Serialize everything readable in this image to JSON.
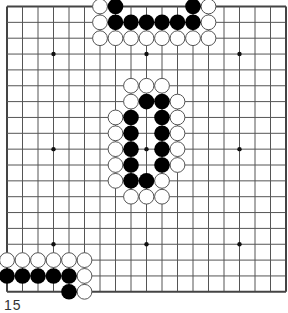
{
  "board": {
    "size": 19,
    "origin_x": 7,
    "origin_y": 6.5,
    "step_x": 15.5,
    "step_y": 15.85,
    "stone_radius": 7.4,
    "line_color": "#555555",
    "border_color": "#444444",
    "background": "#ffffff",
    "black_color": "#000000",
    "white_fill": "#ffffff",
    "white_stroke": "#555555",
    "star_points": [
      [
        3,
        3
      ],
      [
        9,
        3
      ],
      [
        15,
        3
      ],
      [
        3,
        9
      ],
      [
        9,
        9
      ],
      [
        15,
        9
      ],
      [
        3,
        15
      ],
      [
        9,
        15
      ],
      [
        15,
        15
      ]
    ],
    "stones": {
      "black": [
        [
          7,
          0
        ],
        [
          12,
          0
        ],
        [
          7,
          1
        ],
        [
          8,
          1
        ],
        [
          9,
          1
        ],
        [
          10,
          1
        ],
        [
          11,
          1
        ],
        [
          12,
          1
        ],
        [
          9,
          6
        ],
        [
          10,
          6
        ],
        [
          8,
          7
        ],
        [
          10,
          7
        ],
        [
          8,
          8
        ],
        [
          10,
          8
        ],
        [
          8,
          9
        ],
        [
          10,
          9
        ],
        [
          8,
          10
        ],
        [
          10,
          10
        ],
        [
          8,
          11
        ],
        [
          9,
          11
        ],
        [
          0,
          17
        ],
        [
          1,
          17
        ],
        [
          2,
          17
        ],
        [
          3,
          17
        ],
        [
          4,
          17
        ],
        [
          4,
          18
        ]
      ],
      "white": [
        [
          6,
          0
        ],
        [
          13,
          0
        ],
        [
          6,
          1
        ],
        [
          13,
          1
        ],
        [
          6,
          2
        ],
        [
          7,
          2
        ],
        [
          8,
          2
        ],
        [
          9,
          2
        ],
        [
          10,
          2
        ],
        [
          11,
          2
        ],
        [
          12,
          2
        ],
        [
          13,
          2
        ],
        [
          8,
          5
        ],
        [
          9,
          5
        ],
        [
          10,
          5
        ],
        [
          8,
          6
        ],
        [
          11,
          6
        ],
        [
          7,
          7
        ],
        [
          11,
          7
        ],
        [
          7,
          8
        ],
        [
          11,
          8
        ],
        [
          7,
          9
        ],
        [
          11,
          9
        ],
        [
          7,
          10
        ],
        [
          11,
          10
        ],
        [
          7,
          11
        ],
        [
          10,
          11
        ],
        [
          8,
          12
        ],
        [
          9,
          12
        ],
        [
          10,
          12
        ],
        [
          0,
          16
        ],
        [
          1,
          16
        ],
        [
          2,
          16
        ],
        [
          3,
          16
        ],
        [
          4,
          16
        ],
        [
          5,
          16
        ],
        [
          5,
          17
        ],
        [
          5,
          18
        ]
      ]
    }
  },
  "caption": {
    "text": "15"
  }
}
